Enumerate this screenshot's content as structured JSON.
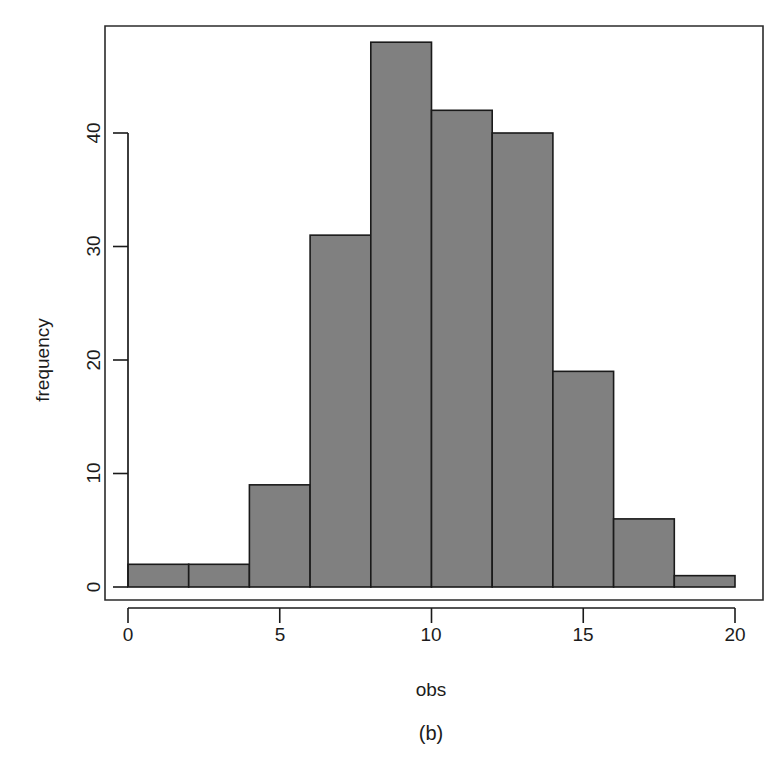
{
  "figure": {
    "background_color": "#ffffff",
    "panel_label": "(b)"
  },
  "chart_data": {
    "type": "bar",
    "subtype": "histogram",
    "title": "",
    "subtitle": "",
    "xlabel": "obs",
    "ylabel": "frequency",
    "xlim": [
      0,
      20
    ],
    "ylim": [
      0,
      48
    ],
    "xticks": [
      0,
      5,
      10,
      15,
      20
    ],
    "xtick_labels": [
      "0",
      "5",
      "10",
      "15",
      "20"
    ],
    "yticks": [
      0,
      10,
      20,
      30,
      40
    ],
    "ytick_labels": [
      "0",
      "10",
      "20",
      "30",
      "40"
    ],
    "grid": false,
    "legend": null,
    "bin_width": 2,
    "bin_edges": [
      0,
      2,
      4,
      6,
      8,
      10,
      12,
      14,
      16,
      18,
      20
    ],
    "categories": [
      "0-2",
      "2-4",
      "4-6",
      "6-8",
      "8-10",
      "10-12",
      "12-14",
      "14-16",
      "16-18",
      "18-20"
    ],
    "values": [
      2,
      2,
      9,
      31,
      48,
      42,
      40,
      19,
      6,
      1
    ],
    "bar_fill_color": "#808080",
    "bar_edge_color": "#1a1a1a",
    "total_count": 200,
    "annotations": []
  },
  "axes": {
    "y_axis_title": "frequency",
    "x_axis_title": "obs",
    "y_tick_labels": [
      "0",
      "10",
      "20",
      "30",
      "40"
    ],
    "x_tick_labels": [
      "0",
      "5",
      "10",
      "15",
      "20"
    ]
  }
}
